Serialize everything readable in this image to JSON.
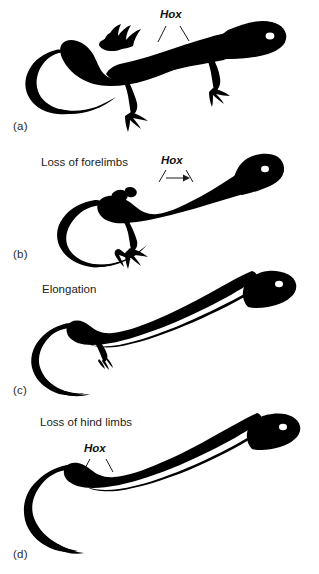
{
  "figure": {
    "background_color": "#ffffff",
    "silhouette_color": "#000000",
    "eye_color": "#ffffff",
    "leader_line_color": "#1a1a1a"
  },
  "panels": [
    {
      "id": "a",
      "label": "(a)",
      "caption": "",
      "hox_label": "Hox",
      "hox_marker": "two-leader-lines",
      "description": "Ancestral lizard with four limbs, long tail, head with eye",
      "limbs": "forelimbs and hind limbs present"
    },
    {
      "id": "b",
      "label": "(b)",
      "caption": "Loss of forelimbs",
      "hox_label": "Hox",
      "hox_marker": "two-leader-lines-with-right-arrow",
      "description": "Lizard body with forelimbs lost, hind limbs retained, looping tail",
      "limbs": "hind limbs only"
    },
    {
      "id": "c",
      "label": "(c)",
      "caption": "Elongation",
      "hox_label": "",
      "hox_marker": "none",
      "description": "Greatly elongated trunk with reduced vestigial hind limb",
      "limbs": "vestigial hind limbs"
    },
    {
      "id": "d",
      "label": "(d)",
      "caption": "Loss of hind limbs",
      "hox_label": "Hox",
      "hox_marker": "two-leader-lines",
      "description": "Fully limbless snake-like body with curved tail",
      "limbs": "no limbs"
    }
  ]
}
